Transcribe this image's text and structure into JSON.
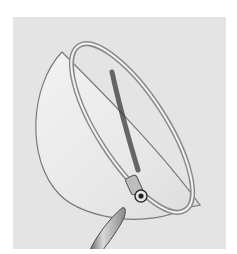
{
  "image": {
    "description": "Grayscale photograph of a hemispherical glass dish with a rolled rim, a short tube at the lower edge, and a pointed glass pipette tip entering from the bottom",
    "colors": {
      "background": "#e4e4e4",
      "page": "#ffffff",
      "outline": "#6a6a6a",
      "shadow": "#3a3a3a",
      "glass_fill": "#eaeaea"
    }
  }
}
